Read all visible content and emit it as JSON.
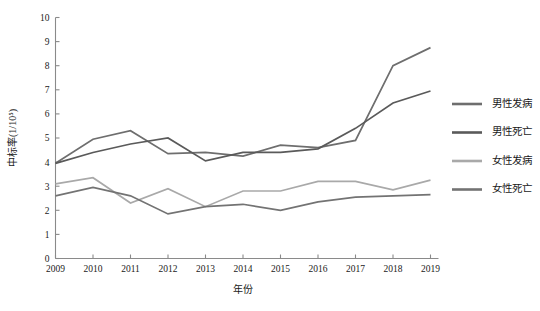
{
  "chart_data": {
    "type": "line",
    "title": "",
    "xlabel": "年份",
    "ylabel": "中标率(1/10⁵)",
    "x": [
      2009,
      2010,
      2011,
      2012,
      2013,
      2014,
      2015,
      2016,
      2017,
      2018,
      2019
    ],
    "categories": [
      "2009",
      "2010",
      "2011",
      "2012",
      "2013",
      "2014",
      "2015",
      "2016",
      "2017",
      "2018",
      "2019"
    ],
    "xlim": [
      2009,
      2019
    ],
    "ylim": [
      0,
      10
    ],
    "yticks": [
      0,
      1,
      2,
      3,
      4,
      5,
      6,
      7,
      8,
      9,
      10
    ],
    "ytick_labels": [
      "0",
      "1",
      "2",
      "3",
      "4",
      "5",
      "6",
      "7",
      "8",
      "9",
      "10"
    ],
    "grid": false,
    "legend_position": "right",
    "series": [
      {
        "name": "男性发病",
        "color": "#6e6e6e",
        "values": [
          3.95,
          4.95,
          5.3,
          4.35,
          4.4,
          4.25,
          4.7,
          4.6,
          4.9,
          8.0,
          8.75
        ]
      },
      {
        "name": "男性死亡",
        "color": "#5a5a5a",
        "values": [
          3.95,
          4.4,
          4.75,
          5.0,
          4.05,
          4.4,
          4.4,
          4.55,
          5.4,
          6.45,
          6.95
        ]
      },
      {
        "name": "女性发病",
        "color": "#a9a9a9",
        "values": [
          3.1,
          3.35,
          2.3,
          2.9,
          2.15,
          2.8,
          2.8,
          3.2,
          3.2,
          2.85,
          3.25
        ]
      },
      {
        "name": "女性死亡",
        "color": "#737373",
        "values": [
          2.6,
          2.95,
          2.6,
          1.85,
          2.15,
          2.25,
          2.0,
          2.35,
          2.55,
          2.6,
          2.65
        ]
      }
    ]
  },
  "axes": {
    "y_title": "中标率(1/10⁵)",
    "x_title": "年份"
  },
  "legend": {
    "items": [
      {
        "label": "男性发病",
        "color": "#6e6e6e"
      },
      {
        "label": "男性死亡",
        "color": "#5a5a5a"
      },
      {
        "label": "女性发病",
        "color": "#a9a9a9"
      },
      {
        "label": "女性死亡",
        "color": "#737373"
      }
    ]
  },
  "colors": {
    "axis": "#8a8a8a",
    "text": "#1a1a1a",
    "background": "#ffffff"
  }
}
